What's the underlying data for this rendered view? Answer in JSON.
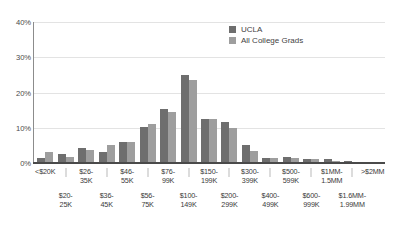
{
  "chart_data": {
    "type": "bar",
    "title": "",
    "subtitle": "",
    "xlabel": "",
    "ylabel": "",
    "ylim": [
      0,
      40
    ],
    "yticks": [
      "40%",
      "30%",
      "20%",
      "10%",
      "0%"
    ],
    "ytick_values": [
      40,
      30,
      20,
      10,
      0
    ],
    "grid": true,
    "legend_position": "top-right",
    "categories": [
      "<$20K",
      "$20-25K",
      "$26-35K",
      "$36-45K",
      "$46-55K",
      "$56-75K",
      "$76-99K",
      "$100-149K",
      "$150-199K",
      "$200-299K",
      "$300-399K",
      "$400-499K",
      "$500-599K",
      "$600-999K",
      "$1MM-1.5MM",
      "$1.6MM-1.99MM",
      ">$2MM"
    ],
    "category_lines": [
      [
        "<$20K"
      ],
      [
        "$20-",
        "25K"
      ],
      [
        "$26-",
        "35K"
      ],
      [
        "$36-",
        "45K"
      ],
      [
        "$46-",
        "55K"
      ],
      [
        "$56-",
        "75K"
      ],
      [
        "$76-",
        "99K"
      ],
      [
        "$100-",
        "149K"
      ],
      [
        "$150-",
        "199K"
      ],
      [
        "$200-",
        "299K"
      ],
      [
        "$300-",
        "399K"
      ],
      [
        "$400-",
        "499K"
      ],
      [
        "$500-",
        "599K"
      ],
      [
        "$600-",
        "999K"
      ],
      [
        "$1MM-",
        "1.5MM"
      ],
      [
        "$1.6MM-",
        "1.99MM"
      ],
      [
        ">$2MM"
      ]
    ],
    "category_rows": [
      "top",
      "bot",
      "top",
      "bot",
      "top",
      "bot",
      "top",
      "bot",
      "top",
      "bot",
      "top",
      "bot",
      "top",
      "bot",
      "top",
      "bot",
      "top"
    ],
    "series": [
      {
        "name": "UCLA",
        "color": "#6e6e6e",
        "values": [
          1.4,
          2.5,
          4.2,
          3.1,
          6.1,
          10.3,
          15.3,
          25.0,
          12.4,
          11.5,
          5.0,
          1.4,
          1.6,
          1.2,
          1.1,
          0.5,
          0.2
        ]
      },
      {
        "name": "All College Grads",
        "color": "#9e9e9e",
        "values": [
          3.0,
          1.8,
          3.7,
          5.1,
          6.0,
          11.2,
          14.6,
          23.5,
          12.4,
          9.8,
          3.5,
          1.3,
          1.3,
          1.0,
          0.7,
          0.3,
          0.1
        ]
      }
    ]
  },
  "legend": {
    "items": [
      {
        "label": "UCLA"
      },
      {
        "label": "All College Grads"
      }
    ]
  }
}
